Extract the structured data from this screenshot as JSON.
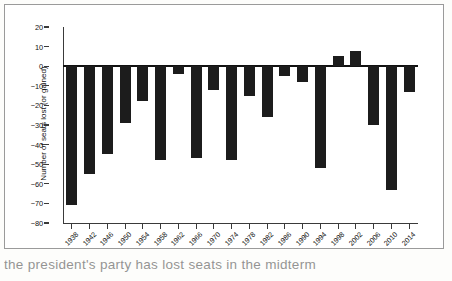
{
  "chart_data": {
    "type": "bar",
    "title": "",
    "xlabel": "",
    "ylabel": "Number of seats lost (or gained)",
    "categories": [
      "1938",
      "1942",
      "1946",
      "1950",
      "1954",
      "1958",
      "1962",
      "1966",
      "1970",
      "1974",
      "1978",
      "1982",
      "1986",
      "1990",
      "1994",
      "1998",
      "2002",
      "2006",
      "2010",
      "2014"
    ],
    "values": [
      -71,
      -55,
      -45,
      -29,
      -18,
      -48,
      -4,
      -47,
      -12,
      -48,
      -15,
      -26,
      -5,
      -8,
      -52,
      5,
      8,
      -30,
      -63,
      -13
    ],
    "ylim": [
      -80,
      20
    ],
    "ytick_labels": [
      "20",
      "10",
      "0",
      "−10",
      "−20",
      "−30",
      "−40",
      "−50",
      "−60",
      "−70",
      "−80"
    ],
    "ytick_values": [
      20,
      10,
      0,
      -10,
      -20,
      -30,
      -40,
      -50,
      -60,
      -70,
      -80
    ],
    "grid": false,
    "legend": "none",
    "bar_color": "#1c1c1c",
    "axis_color": "#3a3a3a"
  },
  "figure": {
    "caption_fragment": "the president's party has lost seats in the midterm"
  }
}
